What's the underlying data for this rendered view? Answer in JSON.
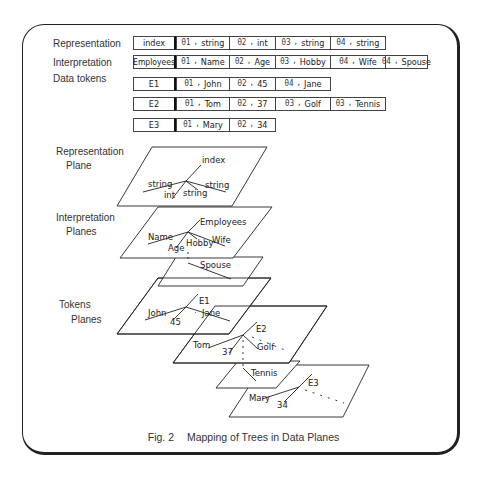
{
  "tables": {
    "representation": {
      "label": "Representation",
      "key": "index",
      "pairs": [
        {
          "theta": "θ1",
          "value": "string"
        },
        {
          "theta": "θ2",
          "value": "int"
        },
        {
          "theta": "θ3",
          "value": "string"
        },
        {
          "theta": "θ4",
          "value": "string"
        }
      ]
    },
    "interpretation": {
      "label": "Interpretation",
      "key": "Employees",
      "pairs": [
        {
          "theta": "θ1",
          "value": "Name"
        },
        {
          "theta": "θ2",
          "value": "Age"
        },
        {
          "theta": "θ3",
          "value": "Hobby"
        },
        {
          "theta": "θ4",
          "value": "Wife"
        },
        {
          "theta": "θ4",
          "value": "Spouse"
        }
      ]
    },
    "data_tokens_label": "Data tokens",
    "tokens": [
      {
        "key": "E1",
        "pairs": [
          {
            "theta": "θ1",
            "value": "John"
          },
          {
            "theta": "θ2",
            "value": "45"
          },
          {
            "theta": "θ4",
            "value": "Jane"
          }
        ]
      },
      {
        "key": "E2",
        "pairs": [
          {
            "theta": "θ1",
            "value": "Tom"
          },
          {
            "theta": "θ2",
            "value": "37"
          },
          {
            "theta": "θ3",
            "value": "Golf"
          },
          {
            "theta": "θ3",
            "value": "Tennis"
          }
        ]
      },
      {
        "key": "E3",
        "pairs": [
          {
            "theta": "θ1",
            "value": "Mary"
          },
          {
            "theta": "θ2",
            "value": "34"
          }
        ]
      }
    ]
  },
  "planes": {
    "representation_label_1": "Representation",
    "representation_label_2": "Plane",
    "interpretation_label_1": "Interpretation",
    "interpretation_label_2": "Planes",
    "tokens_label_1": "Tokens",
    "tokens_label_2": "Planes",
    "representation_tree": {
      "root": "index",
      "leaves": [
        "string",
        "int",
        "string",
        "string"
      ]
    },
    "interpretation_tree": {
      "root": "Employees",
      "leaves": [
        "Name",
        "Age",
        "Hobby",
        "Wife"
      ],
      "extra": "Spouse"
    },
    "e1_tree": {
      "root": "E1",
      "leaves": [
        "John",
        "45",
        "Jane"
      ]
    },
    "e2_tree": {
      "root": "E2",
      "leaves": [
        "Tom",
        "37",
        "Golf"
      ],
      "extra": "Tennis"
    },
    "e3_tree": {
      "root": "E3",
      "leaves": [
        "Mary",
        "34"
      ]
    }
  },
  "caption": {
    "fig": "Fig. 2",
    "title": "Mapping of Trees in Data Planes"
  }
}
